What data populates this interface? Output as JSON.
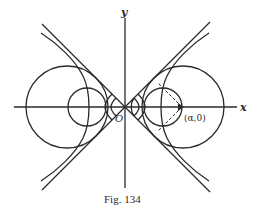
{
  "figure": {
    "caption": "Fig. 134",
    "axis_labels": {
      "x": "x",
      "y": "y",
      "origin": "O"
    },
    "point_label": "(α,0)",
    "colors": {
      "ink": "#2a2a2a",
      "background": "#ffffff"
    },
    "elements": [
      "x-axis",
      "y-axis",
      "two asymptotes through origin (±45°)",
      "hyperbola (both branches)",
      "family of circles centered on x-axis tangent to asymptotes",
      "dashed tangent lines from (α,0) to small circle"
    ]
  }
}
